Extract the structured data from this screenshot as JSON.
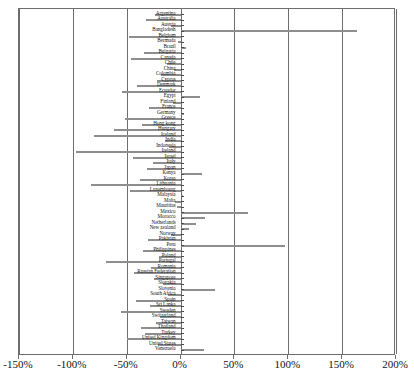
{
  "chart_data": {
    "type": "bar",
    "orientation": "horizontal",
    "title": "",
    "xlabel": "",
    "ylabel": "",
    "xlim": [
      -150,
      200
    ],
    "xticks": [
      -150,
      -100,
      -50,
      0,
      50,
      100,
      150,
      200
    ],
    "xtick_labels": [
      "-150%",
      "-100%",
      "-50%",
      "0%",
      "50%",
      "100%",
      "150%",
      "200%"
    ],
    "grid": true,
    "grid_axis": "x",
    "legend": null,
    "bar_color": "#8e8e8e",
    "categories": [
      "Argentina",
      "Australia",
      "Austria",
      "Bangladesh",
      "Belgium",
      "Bermuda",
      "Brazil",
      "Bulgaria",
      "Canada",
      "Chile",
      "China",
      "Colombia",
      "Cyprus",
      "Denmark",
      "Ecuador",
      "Egypt",
      "Finland",
      "France",
      "Germany",
      "Greece",
      "Hong kong",
      "Hungary",
      "Iceland",
      "India",
      "Indonesia",
      "Ireland",
      "Israel",
      "Italy",
      "Japan",
      "Kenya",
      "Korea",
      "Lithuania",
      "Luxembourg",
      "Malaysia",
      "Malta",
      "Mauritius",
      "Mexico",
      "Morocco",
      "Netherlands",
      "New zealand",
      "Norway",
      "Pakistan",
      "Peru",
      "Philippines",
      "Poland",
      "Portugal",
      "Romania",
      "Russian Federation",
      "Singapore",
      "Slovakia",
      "Slovenia",
      "South Africa",
      "Spain",
      "Sri Lanka",
      "Sweden",
      "Switzerland",
      "Taiwan",
      "Thailand",
      "Turkey",
      "United Kingdom",
      "United States",
      "Venezuela"
    ],
    "values": [
      -24,
      -32,
      -9,
      164,
      -48,
      -2,
      5,
      -34,
      -46,
      -13,
      -6,
      -18,
      -22,
      -40,
      -54,
      18,
      -7,
      -29,
      3,
      -52,
      -36,
      -62,
      -80,
      -14,
      -11,
      -97,
      -44,
      -26,
      -31,
      20,
      -38,
      -83,
      -47,
      2,
      -5,
      -3,
      63,
      23,
      14,
      8,
      -9,
      -30,
      97,
      -35,
      -20,
      -69,
      -27,
      -43,
      -25,
      -16,
      32,
      -12,
      -41,
      -28,
      -55,
      -19,
      -23,
      -37,
      -33,
      -50,
      -21,
      22
    ]
  }
}
